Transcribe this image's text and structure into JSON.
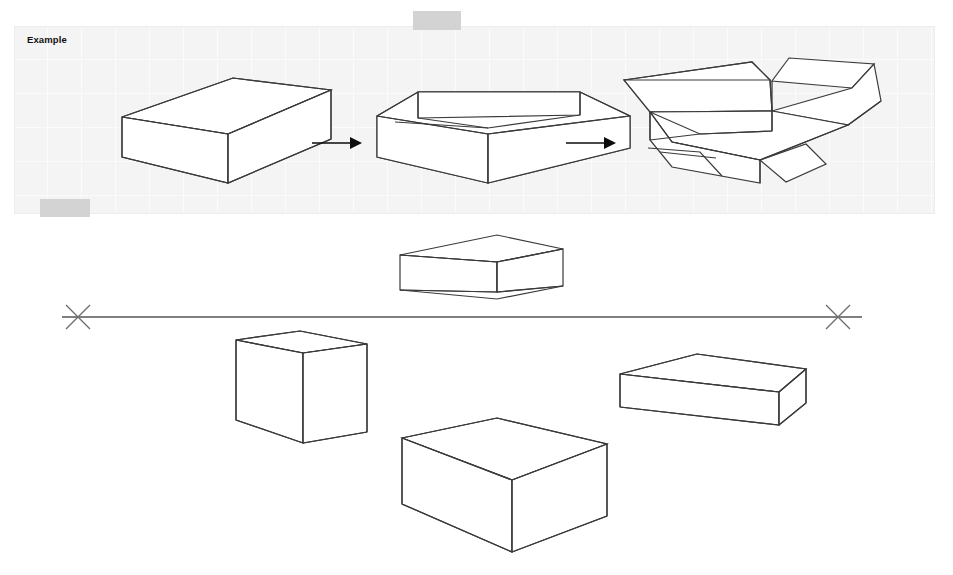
{
  "page": {
    "background_color": "#ffffff",
    "width": 953,
    "height": 575
  },
  "example_panel": {
    "label": "Example",
    "background_color": "#f4f4f4",
    "grid_line_color": "#fbfbfb",
    "grid_spacing_px": 34,
    "bounds": {
      "x": 14,
      "y": 26,
      "width": 921,
      "height": 188
    },
    "caption_visible": true,
    "steps": [
      {
        "index": 1,
        "name": "closed-box",
        "description": "Closed rectangular box in three-quarter view"
      },
      {
        "index": 2,
        "name": "open-box",
        "description": "Same box with the top lid removed, interior walls visible"
      },
      {
        "index": 3,
        "name": "box-with-open-flaps",
        "description": "Box with four flaps splayed open outward"
      }
    ],
    "connectors": [
      {
        "name": "arrow-step-1-to-2",
        "glyph": "right-arrow-icon"
      },
      {
        "name": "arrow-step-2-to-3",
        "glyph": "right-arrow-icon"
      }
    ]
  },
  "redactions": [
    {
      "name": "redaction-top-center",
      "color": "#cfcfcf"
    },
    {
      "name": "redaction-panel-lower-left",
      "color": "#cfcfcf"
    }
  ],
  "workspace": {
    "horizon": {
      "name": "horizon-line",
      "color": "#555555",
      "y": 317,
      "x_start": 62,
      "x_end": 862
    },
    "vanishing_points": [
      {
        "name": "vanishing-point-left",
        "glyph": "x-mark-icon",
        "x": 78,
        "y": 317
      },
      {
        "name": "vanishing-point-right",
        "glyph": "x-mark-icon",
        "x": 838,
        "y": 317
      }
    ],
    "boxes": [
      {
        "name": "box-eye-level",
        "description": "Flat box drawn on the horizon line, top plane nearly edge-on"
      },
      {
        "name": "box-tall-left",
        "description": "Tall upright box below and left of the horizon"
      },
      {
        "name": "box-thick-center",
        "description": "Thick low box centered beneath the horizon, top plane fully visible"
      },
      {
        "name": "box-flat-right",
        "description": "Shallow wide box at right, slightly below the horizon"
      }
    ]
  },
  "colors": {
    "ink": "#3a3a3a",
    "arrow": "#0d0d0d",
    "panel_background": "#f4f4f4",
    "redaction": "#cfcfcf",
    "horizon": "#555555"
  }
}
